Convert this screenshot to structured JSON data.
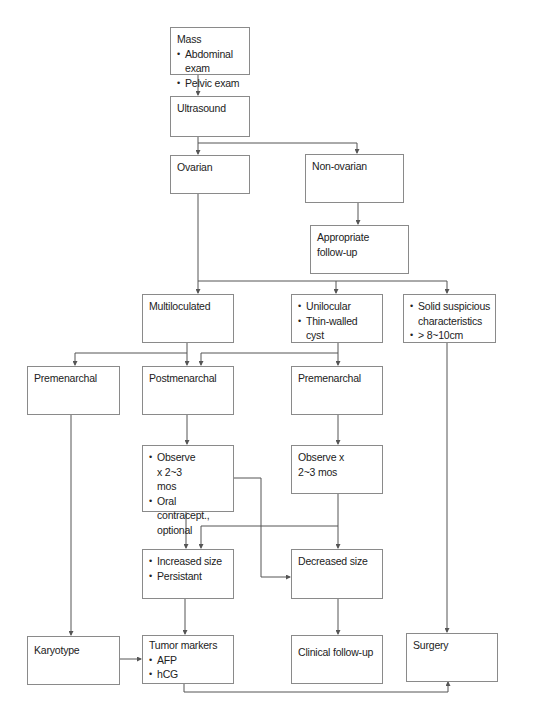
{
  "diagram": {
    "nodes": {
      "mass": {
        "title": "Mass",
        "bullets": [
          "Abdominal exam",
          "Pelvic exam"
        ]
      },
      "ultrasound": {
        "title": "Ultrasound"
      },
      "ovarian": {
        "title": "Ovarian"
      },
      "non_ovarian": {
        "title": "Non-ovarian"
      },
      "appropriate_follow_up": {
        "title": "Appropriate follow-up"
      },
      "multiloculated": {
        "title": "Multiloculated"
      },
      "unilocular": {
        "bullets": [
          "Unilocular",
          "Thin-walled cyst"
        ]
      },
      "solid": {
        "bullets": [
          "Solid suspicious characteristics",
          "> 8~10cm"
        ]
      },
      "premenarchal_left": {
        "title": "Premenarchal"
      },
      "postmenarchal": {
        "title": "Postmenarchal"
      },
      "premenarchal_right": {
        "title": "Premenarchal"
      },
      "observe_left": {
        "bullets": [
          "Observe x 2~3 mos",
          "Oral contracept., optional"
        ]
      },
      "observe_right": {
        "title": "Observe x 2~3 mos"
      },
      "increased_size": {
        "bullets": [
          "Increased size",
          "Persistant"
        ]
      },
      "decreased_size": {
        "title": "Decreased size"
      },
      "karyotype": {
        "title": "Karyotype"
      },
      "tumor_markers": {
        "title": "Tumor markers",
        "bullets": [
          "AFP",
          "hCG"
        ]
      },
      "clinical_follow_up": {
        "title": "Clinical follow-up"
      },
      "surgery": {
        "title": "Surgery"
      }
    },
    "edges": [
      [
        "mass",
        "ultrasound"
      ],
      [
        "ultrasound",
        "ovarian"
      ],
      [
        "ultrasound",
        "non_ovarian"
      ],
      [
        "non_ovarian",
        "appropriate_follow_up"
      ],
      [
        "ovarian",
        "multiloculated"
      ],
      [
        "ovarian",
        "unilocular"
      ],
      [
        "ovarian",
        "solid"
      ],
      [
        "multiloculated",
        "premenarchal_left"
      ],
      [
        "multiloculated",
        "postmenarchal"
      ],
      [
        "unilocular",
        "postmenarchal"
      ],
      [
        "unilocular",
        "premenarchal_right"
      ],
      [
        "postmenarchal",
        "observe_left"
      ],
      [
        "premenarchal_right",
        "observe_right"
      ],
      [
        "observe_left",
        "increased_size"
      ],
      [
        "observe_left",
        "decreased_size"
      ],
      [
        "observe_right",
        "increased_size"
      ],
      [
        "observe_right",
        "decreased_size"
      ],
      [
        "premenarchal_left",
        "karyotype"
      ],
      [
        "karyotype",
        "tumor_markers"
      ],
      [
        "increased_size",
        "tumor_markers"
      ],
      [
        "decreased_size",
        "clinical_follow_up"
      ],
      [
        "solid",
        "surgery"
      ],
      [
        "tumor_markers",
        "surgery"
      ]
    ],
    "colors": {
      "line": "#555555",
      "border": "#8a8a8a",
      "background": "#ffffff"
    }
  }
}
